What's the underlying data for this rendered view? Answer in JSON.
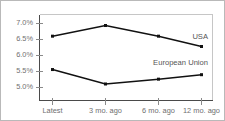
{
  "chart_data": {
    "type": "line",
    "title": "",
    "subtitle": "",
    "xlabel": "",
    "ylabel": "",
    "categories": [
      "Latest",
      "3 mo. ago",
      "6 mo. ago",
      "12 mo. ago"
    ],
    "series": [
      {
        "name": "USA",
        "values": [
          6.62,
          6.93,
          6.62,
          6.32
        ]
      },
      {
        "name": "European Union",
        "values": [
          5.65,
          5.23,
          5.37,
          5.5
        ]
      }
    ],
    "ylim": [
      4.75,
      7.25
    ],
    "yticks": [
      5.0,
      5.5,
      6.0,
      6.5,
      7.0
    ],
    "ytick_labels": [
      "5.0%",
      "5.5%",
      "6.0%",
      "6.5%",
      "7.0%"
    ],
    "xtick_labels": [
      "Latest",
      "3 mo. ago",
      "6 mo. ago",
      "12 mo. ago"
    ],
    "grid": false,
    "legend": "inline-series-labels",
    "annotations": [
      {
        "text": "USA",
        "series": "USA"
      },
      {
        "text": "European Union",
        "series": "European Union"
      }
    ],
    "colors": {
      "line": "#111111",
      "marker": "#111111",
      "tick_label": "#6f6f6f",
      "series_label": "#555555",
      "axis": "#4a4a4a",
      "frame": "#c6c6c6",
      "background": "#ffffff"
    }
  }
}
